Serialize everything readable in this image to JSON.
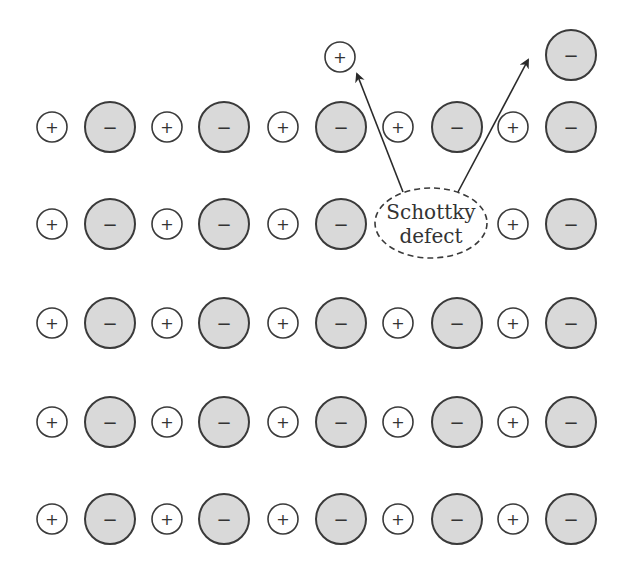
{
  "diagram": {
    "colors": {
      "anion_fill": "#d9d9d9",
      "cation_fill": "#ffffff",
      "stroke": "#3a3a3a"
    },
    "cation_symbol": "+",
    "anion_symbol": "−",
    "row_y": [
      127,
      224,
      323,
      422,
      519
    ],
    "column_x": [
      52,
      110,
      167,
      224,
      283,
      341,
      398,
      457,
      513,
      571
    ],
    "column_types": [
      "cation",
      "anion",
      "cation",
      "anion",
      "cation",
      "anion",
      "cation",
      "anion",
      "cation",
      "anion"
    ],
    "vacancies": [
      {
        "row": 1,
        "col": 6,
        "type": "cation"
      },
      {
        "row": 1,
        "col": 7,
        "type": "anion"
      }
    ],
    "displaced_ions": [
      {
        "type": "cation",
        "x": 340,
        "y": 57,
        "symbol": "+"
      },
      {
        "type": "anion",
        "x": 571,
        "y": 55,
        "symbol": "−"
      }
    ],
    "callout": {
      "line1": "Schottky",
      "line2": "defect",
      "cx": 431,
      "cy": 223,
      "rx": 56,
      "ry": 35
    },
    "arrows": [
      {
        "from": [
          403,
          192
        ],
        "to": [
          357,
          74
        ]
      },
      {
        "from": [
          458,
          192
        ],
        "to": [
          528,
          60
        ]
      }
    ]
  }
}
